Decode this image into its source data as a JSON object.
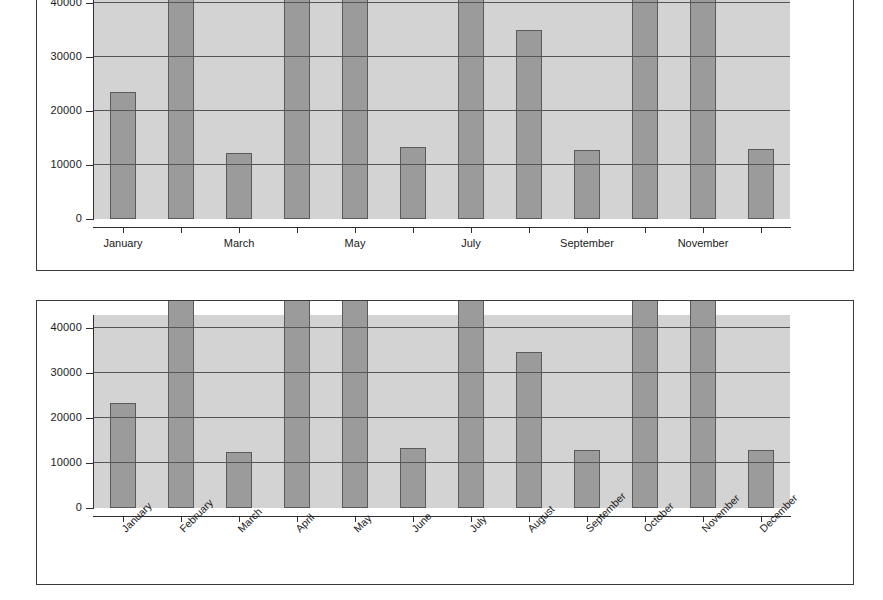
{
  "chart_data": [
    {
      "id": "top",
      "type": "bar",
      "title": "",
      "xlabel": "",
      "ylabel": "",
      "categories": [
        "January",
        "February",
        "March",
        "April",
        "May",
        "June",
        "July",
        "August",
        "September",
        "October",
        "November",
        "December"
      ],
      "values": [
        23500,
        44000,
        12300,
        44000,
        44000,
        13400,
        44000,
        35000,
        12700,
        44000,
        44000,
        12900
      ],
      "clipped": [
        false,
        true,
        false,
        true,
        true,
        false,
        true,
        false,
        false,
        true,
        true,
        false
      ],
      "ylim": [
        0,
        43000
      ],
      "yticks": [
        0,
        10000,
        20000,
        30000,
        40000
      ],
      "ytick_labels": [
        "0",
        "10000",
        "20000",
        "30000",
        "40000"
      ],
      "visible_xtick_labels": [
        "January",
        "March",
        "May",
        "July",
        "September",
        "November"
      ],
      "xtick_label_rotation": 0,
      "grid": true,
      "legend": "none",
      "note": "Plot area is cropped at the top edge of the screenshot; bars for February, April, May, July, October and November extend past the 40000 axis maximum."
    },
    {
      "id": "bottom",
      "type": "bar",
      "title": "",
      "xlabel": "",
      "ylabel": "",
      "categories": [
        "January",
        "February",
        "March",
        "April",
        "May",
        "June",
        "July",
        "August",
        "September",
        "October",
        "November",
        "December"
      ],
      "values": [
        23500,
        44000,
        12400,
        44000,
        44000,
        13300,
        44000,
        34800,
        13000,
        44000,
        44000,
        13000
      ],
      "clipped": [
        false,
        true,
        false,
        true,
        true,
        false,
        true,
        false,
        false,
        true,
        true,
        false
      ],
      "ylim": [
        0,
        43000
      ],
      "yticks": [
        0,
        10000,
        20000,
        30000,
        40000
      ],
      "ytick_labels": [
        "0",
        "10000",
        "20000",
        "30000",
        "40000"
      ],
      "visible_xtick_labels": [
        "January",
        "February",
        "March",
        "April",
        "May",
        "June",
        "July",
        "August",
        "September",
        "October",
        "November",
        "December"
      ],
      "xtick_label_rotation": -45,
      "grid": true,
      "legend": "none",
      "note": "Same series as the upper chart, drawn with every month label shown at a 45 degree rotation."
    }
  ],
  "colors": {
    "page_background": "#ffffff",
    "frame_border": "#3a3a3a",
    "plot_background": "#d3d3d3",
    "bar_fill": "#9b9b9b",
    "bar_border": "#5a5a5a",
    "gridline": "#555555",
    "axis": "#2f2f2f",
    "text": "#1a1a1a"
  }
}
